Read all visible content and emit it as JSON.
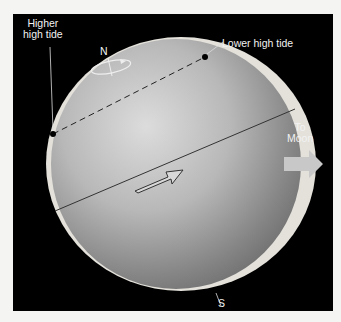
{
  "figure": {
    "labels": {
      "higher_high_tide_line1": "Higher",
      "higher_high_tide_line2": "high tide",
      "lower_high_tide": "Lower high tide",
      "north": "N",
      "south": "S",
      "to_moon_line1": "To",
      "to_moon_line2": "Moon"
    },
    "colors": {
      "background": "#000000",
      "tidal_bulge": "#e6e3dc",
      "earth_light": "#d9d9d9",
      "earth_dark": "#6e6e6e",
      "moon_arrow": "#c8c8c8"
    }
  }
}
